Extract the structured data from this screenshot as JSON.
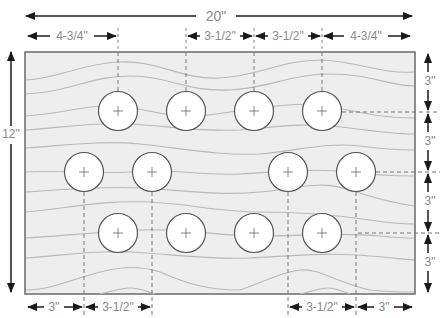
{
  "colors": {
    "board_fill": "#eeeeee",
    "board_stroke": "#6a6a6a",
    "grain": "#b8b8b8",
    "hole_fill": "#ffffff",
    "hole_stroke": "#555555",
    "arrow": "#1a1a1a",
    "label": "#8a8a8a",
    "guide": "#777777"
  },
  "board": {
    "width_label": "20\"",
    "height_label": "12\""
  },
  "top_dimensions": [
    {
      "label": "4-3/4\""
    },
    {
      "label": "3-1/2\""
    },
    {
      "label": "3-1/2\""
    },
    {
      "label": "4-3/4\""
    }
  ],
  "bottom_dimensions": [
    {
      "label": "3\""
    },
    {
      "label": "3-1/2\""
    },
    {
      "label": "3-1/2\""
    },
    {
      "label": "3\""
    }
  ],
  "right_dimensions": [
    {
      "label": "3\""
    },
    {
      "label": "3\""
    },
    {
      "label": "3\""
    },
    {
      "label": "3\""
    }
  ],
  "holes": {
    "rows": [
      {
        "row": 1,
        "count": 4
      },
      {
        "row": 2,
        "count": 4
      },
      {
        "row": 3,
        "count": 4
      }
    ],
    "total": 12
  }
}
